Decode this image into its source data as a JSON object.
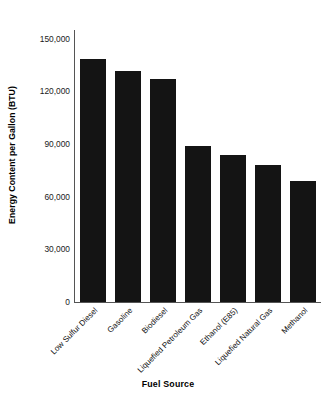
{
  "chart_data": {
    "type": "bar",
    "title": "",
    "xlabel": "Fuel Source",
    "ylabel": "Energy Content per Gallon (BTU)",
    "categories": [
      "Low Sulfur Diesel",
      "Gasoline",
      "Biodiesel",
      "Liquefied Petroleum Gas",
      "Ethanol (E85)",
      "Liquefied Natural Gas",
      "Methanol"
    ],
    "values": [
      138700,
      131800,
      127000,
      89000,
      84000,
      78000,
      69000
    ],
    "ylim": [
      0,
      155000
    ],
    "yticks": [
      0,
      30000,
      60000,
      90000,
      120000,
      150000
    ],
    "ytick_labels": [
      "0",
      "30,000",
      "60,000",
      "90,000",
      "120,000",
      "150,000"
    ],
    "grid": false,
    "legend": "none",
    "bar_color": "#141414",
    "axis_color": "#555555",
    "background_color": "#ffffff"
  }
}
